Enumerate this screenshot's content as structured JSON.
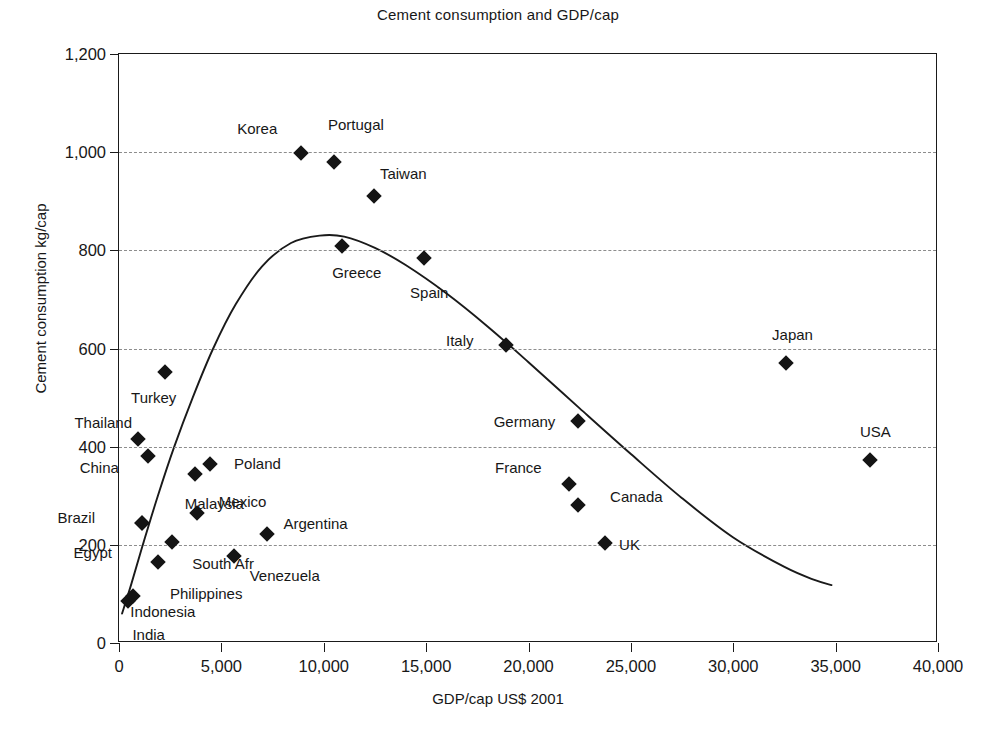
{
  "chart_data": {
    "type": "scatter",
    "title": "Cement consumption and GDP/cap",
    "xlabel": "GDP/cap US$ 2001",
    "ylabel": "Cement consumption kg/cap",
    "xlim": [
      0,
      40000
    ],
    "ylim": [
      0,
      1200
    ],
    "xticks": [
      "0",
      "5,000",
      "10,000",
      "15,000",
      "20,000",
      "25,000",
      "30,000",
      "35,000",
      "40,000"
    ],
    "xtick_values": [
      0,
      5000,
      10000,
      15000,
      20000,
      25000,
      30000,
      35000,
      40000
    ],
    "yticks": [
      "0",
      "200",
      "400",
      "600",
      "800",
      "1,000",
      "1,200"
    ],
    "ytick_values": [
      0,
      200,
      400,
      600,
      800,
      1000,
      1200
    ],
    "grid": "horizontal-dashed",
    "legend": "none",
    "marker_shape": "diamond",
    "marker_color": "#141414",
    "points": [
      {
        "name": "India",
        "x": 460,
        "y": 85,
        "label_dx": 4,
        "label_dy": 34,
        "label_anchor": "start"
      },
      {
        "name": "Indonesia",
        "x": 700,
        "y": 95,
        "label_dx": -3,
        "label_dy": 16,
        "label_anchor": "start"
      },
      {
        "name": "Philippines",
        "x": 1900,
        "y": 165,
        "label_dx": 12,
        "label_dy": 32,
        "label_anchor": "start"
      },
      {
        "name": "Egypt",
        "x": 1100,
        "y": 245,
        "label_dx": -68,
        "label_dy": 30,
        "label_anchor": "start"
      },
      {
        "name": "Brazil",
        "x": 1100,
        "y": 245,
        "label_dx": -84,
        "label_dy": -5,
        "label_anchor": "start"
      },
      {
        "name": "South Afr",
        "x": 2600,
        "y": 205,
        "label_dx": 20,
        "label_dy": 22,
        "label_anchor": "start"
      },
      {
        "name": "Venezuela",
        "x": 5600,
        "y": 178,
        "label_dx": 16,
        "label_dy": 20,
        "label_anchor": "start"
      },
      {
        "name": "Argentina",
        "x": 7250,
        "y": 222,
        "label_dx": 16,
        "label_dy": -10,
        "label_anchor": "start"
      },
      {
        "name": "Mexico",
        "x": 3800,
        "y": 265,
        "label_dx": 22,
        "label_dy": -11,
        "label_anchor": "start"
      },
      {
        "name": "Malaysia",
        "x": 3700,
        "y": 345,
        "label_dx": -10,
        "label_dy": 30,
        "label_anchor": "start"
      },
      {
        "name": "Poland",
        "x": 4450,
        "y": 365,
        "label_dx": 24,
        "label_dy": 0,
        "label_anchor": "start"
      },
      {
        "name": "China",
        "x": 1400,
        "y": 380,
        "label_dx": -68,
        "label_dy": 12,
        "label_anchor": "start"
      },
      {
        "name": "Thailand",
        "x": 950,
        "y": 415,
        "label_dx": -64,
        "label_dy": -16,
        "label_anchor": "start"
      },
      {
        "name": "Turkey",
        "x": 2250,
        "y": 553,
        "label_dx": -34,
        "label_dy": 26,
        "label_anchor": "start"
      },
      {
        "name": "Korea",
        "x": 8900,
        "y": 998,
        "label_dx": -64,
        "label_dy": -24,
        "label_anchor": "start"
      },
      {
        "name": "Portugal",
        "x": 10500,
        "y": 980,
        "label_dx": -6,
        "label_dy": -37,
        "label_anchor": "start"
      },
      {
        "name": "Taiwan",
        "x": 12450,
        "y": 910,
        "label_dx": 6,
        "label_dy": -22,
        "label_anchor": "start"
      },
      {
        "name": "Greece",
        "x": 10900,
        "y": 808,
        "label_dx": -10,
        "label_dy": 27,
        "label_anchor": "start"
      },
      {
        "name": "Spain",
        "x": 14900,
        "y": 785,
        "label_dx": -14,
        "label_dy": 35,
        "label_anchor": "start"
      },
      {
        "name": "Italy",
        "x": 18900,
        "y": 608,
        "label_dx": -60,
        "label_dy": -4,
        "label_anchor": "start"
      },
      {
        "name": "Germany",
        "x": 22400,
        "y": 453,
        "label_dx": -84,
        "label_dy": 1,
        "label_anchor": "start"
      },
      {
        "name": "France",
        "x": 21980,
        "y": 323,
        "label_dx": -74,
        "label_dy": -16,
        "label_anchor": "start"
      },
      {
        "name": "Canada",
        "x": 22420,
        "y": 282,
        "label_dx": 32,
        "label_dy": -8,
        "label_anchor": "start"
      },
      {
        "name": "UK",
        "x": 23740,
        "y": 203,
        "label_dx": 14,
        "label_dy": 2,
        "label_anchor": "start"
      },
      {
        "name": "Japan",
        "x": 32580,
        "y": 570,
        "label_dx": -14,
        "label_dy": -28,
        "label_anchor": "start"
      },
      {
        "name": "USA",
        "x": 36680,
        "y": 373,
        "label_dx": -10,
        "label_dy": -28,
        "label_anchor": "start"
      }
    ],
    "trend_curve": {
      "description": "fitted inverted-U trend line",
      "points": [
        [
          150,
          60
        ],
        [
          600,
          120
        ],
        [
          1200,
          205
        ],
        [
          1900,
          300
        ],
        [
          2700,
          400
        ],
        [
          3600,
          500
        ],
        [
          4600,
          600
        ],
        [
          5700,
          690
        ],
        [
          7000,
          768
        ],
        [
          8400,
          815
        ],
        [
          9800,
          830
        ],
        [
          11000,
          828
        ],
        [
          12500,
          805
        ],
        [
          14000,
          770
        ],
        [
          16000,
          712
        ],
        [
          18000,
          645
        ],
        [
          20000,
          572
        ],
        [
          22500,
          478
        ],
        [
          25000,
          385
        ],
        [
          27500,
          295
        ],
        [
          30000,
          215
        ],
        [
          32500,
          155
        ],
        [
          34000,
          128
        ],
        [
          34800,
          118
        ]
      ]
    }
  }
}
